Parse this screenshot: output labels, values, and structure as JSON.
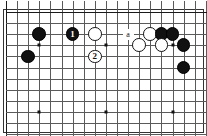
{
  "diagram": {
    "type": "go-board-problem",
    "board": {
      "cols": 18,
      "rows": 11,
      "cell_px": 11.1,
      "origin_x": 5,
      "origin_y": 11,
      "line_color": "#5a5a5a",
      "edge_color": "#1a1a1a",
      "background": "#ffffff",
      "border_color": "#333333"
    },
    "hoshi": [
      {
        "col": 3,
        "row": 3
      },
      {
        "col": 9,
        "row": 3
      },
      {
        "col": 15,
        "row": 3
      },
      {
        "col": 3,
        "row": 9
      },
      {
        "col": 9,
        "row": 9
      },
      {
        "col": 15,
        "row": 9
      }
    ],
    "stones": [
      {
        "col": 3,
        "row": 2,
        "color": "black",
        "label": ""
      },
      {
        "col": 2,
        "row": 4,
        "color": "black",
        "label": ""
      },
      {
        "col": 6,
        "row": 2,
        "color": "black",
        "label": "1"
      },
      {
        "col": 8,
        "row": 2,
        "color": "white",
        "label": ""
      },
      {
        "col": 8,
        "row": 4,
        "color": "white",
        "label": "2"
      },
      {
        "col": 13,
        "row": 2,
        "color": "white",
        "label": ""
      },
      {
        "col": 14,
        "row": 2,
        "color": "black",
        "label": ""
      },
      {
        "col": 15,
        "row": 2,
        "color": "black",
        "label": ""
      },
      {
        "col": 12,
        "row": 3,
        "color": "white",
        "label": ""
      },
      {
        "col": 14,
        "row": 3,
        "color": "white",
        "label": ""
      },
      {
        "col": 16,
        "row": 3,
        "color": "black",
        "label": ""
      },
      {
        "col": 16,
        "row": 5,
        "color": "black",
        "label": ""
      }
    ],
    "point_labels": [
      {
        "col": 11,
        "row": 2,
        "text": "a"
      }
    ]
  }
}
